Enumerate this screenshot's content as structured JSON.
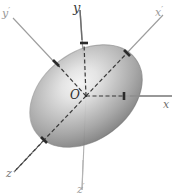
{
  "figure": {
    "background_color": "#ffffff"
  },
  "labels": {
    "origin": "O",
    "x": "x",
    "y": "y",
    "z": "z",
    "x_prime": "x",
    "y_prime": "y",
    "z_prime": "z",
    "prime_mark": "′"
  },
  "colors": {
    "surface_light": "#f2f2f2",
    "surface_mid": "#a8a8a8",
    "surface_dark": "#6e6e6e",
    "surface_edge": "#8a8a8a",
    "axis_solid": "#9b9b9b",
    "axis_primed": "#8e8e8e",
    "axis_dashed": "#3a3a3a",
    "tick": "#2b2b2b",
    "label_text": "#4a4a4a"
  },
  "geometry": {
    "origin_px": [
      86,
      96
    ],
    "ellipsoid_center_px": [
      86,
      96
    ],
    "ellipsoid_semi_major_px": 62,
    "ellipsoid_semi_minor_px": 44,
    "ellipsoid_tilt_deg": -37
  },
  "axes": [
    {
      "name": "x",
      "label": "x",
      "primed": false,
      "style": "solid",
      "from_px": [
        86,
        96
      ],
      "to_px": [
        172,
        96
      ],
      "label_px": [
        165,
        98
      ]
    },
    {
      "name": "y",
      "label": "y",
      "primed": false,
      "style": "solid",
      "from_px": [
        86,
        96
      ],
      "to_px": [
        80,
        10
      ],
      "label_px": [
        76,
        2
      ]
    },
    {
      "name": "z",
      "label": "z",
      "primed": false,
      "style": "dashed",
      "from_px": [
        86,
        96
      ],
      "to_px": [
        14,
        172
      ],
      "label_px": [
        9,
        171
      ]
    },
    {
      "name": "x-prime",
      "label": "x",
      "primed": true,
      "style": "solid",
      "from_px": [
        86,
        96
      ],
      "to_px": [
        163,
        15
      ],
      "label_px": [
        157,
        7
      ]
    },
    {
      "name": "y-prime",
      "label": "y",
      "primed": true,
      "style": "solid",
      "from_px": [
        86,
        96
      ],
      "to_px": [
        13,
        18
      ],
      "label_px": [
        3,
        8
      ]
    },
    {
      "name": "z-prime",
      "label": "z",
      "primed": true,
      "style": "solid",
      "from_px": [
        86,
        96
      ],
      "to_px": [
        82,
        190
      ],
      "label_px": [
        78,
        182
      ]
    }
  ],
  "dashed_segments": [
    {
      "name": "semi-axis-x-dashed",
      "from_px": [
        86,
        96
      ],
      "to_px": [
        124,
        96
      ]
    },
    {
      "name": "semi-axis-y-dashed",
      "from_px": [
        86,
        96
      ],
      "to_px": [
        84,
        43
      ]
    },
    {
      "name": "semi-axis-z-dashed",
      "from_px": [
        86,
        96
      ],
      "to_px": [
        44,
        140
      ]
    },
    {
      "name": "semi-axis-xp-dashed",
      "from_px": [
        86,
        96
      ],
      "to_px": [
        127,
        53
      ]
    },
    {
      "name": "semi-axis-yp-dashed",
      "from_px": [
        86,
        96
      ],
      "to_px": [
        56,
        63
      ]
    }
  ],
  "ticks": [
    {
      "name": "tick-x",
      "at_px": [
        124,
        96
      ],
      "angle_deg": 90
    },
    {
      "name": "tick-y",
      "at_px": [
        84,
        43
      ],
      "angle_deg": 0
    },
    {
      "name": "tick-z",
      "at_px": [
        44,
        140
      ],
      "angle_deg": 45
    },
    {
      "name": "tick-x-prime",
      "at_px": [
        127,
        53
      ],
      "angle_deg": 135
    },
    {
      "name": "tick-y-prime",
      "at_px": [
        56,
        63
      ],
      "angle_deg": 45
    }
  ]
}
